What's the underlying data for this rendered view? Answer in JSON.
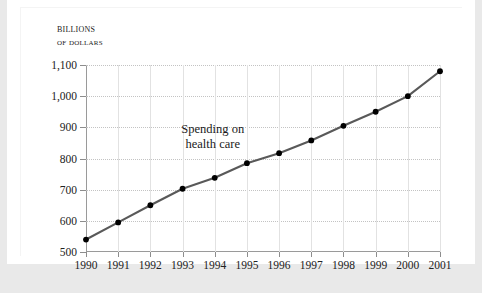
{
  "figure": {
    "axis_title_line1": "Billions",
    "axis_title_line2": "of dollars",
    "annotation_line1": "Spending on",
    "annotation_line2": "health care",
    "line_color": "#595959",
    "marker_color": "#000000",
    "grid_color": "#c3c3c3",
    "axis_color": "#9a9a9a",
    "card_color": "#ffffff",
    "page_color": "#e9e9e9"
  },
  "chart_data": {
    "type": "line",
    "title": "",
    "subtitle": "",
    "xlabel": "",
    "ylabel": "Billions of dollars",
    "annotations": [
      "Spending on health care"
    ],
    "legend": [],
    "legend_position": "none",
    "grid": true,
    "xlim": [
      1990,
      2001
    ],
    "ylim": [
      500,
      1100
    ],
    "ytick_step": 100,
    "categories": [
      "1990",
      "1991",
      "1992",
      "1993",
      "1994",
      "1995",
      "1996",
      "1997",
      "1998",
      "1999",
      "2000",
      "2001"
    ],
    "ytick_labels": [
      "500",
      "600",
      "700",
      "800",
      "900",
      "1,000",
      "1,100"
    ],
    "ytick_values": [
      500,
      600,
      700,
      800,
      900,
      1000,
      1100
    ],
    "series": [
      {
        "name": "Spending on health care",
        "values": [
          540,
          595,
          650,
          703,
          738,
          785,
          817,
          858,
          905,
          950,
          1000,
          1080
        ]
      }
    ]
  }
}
